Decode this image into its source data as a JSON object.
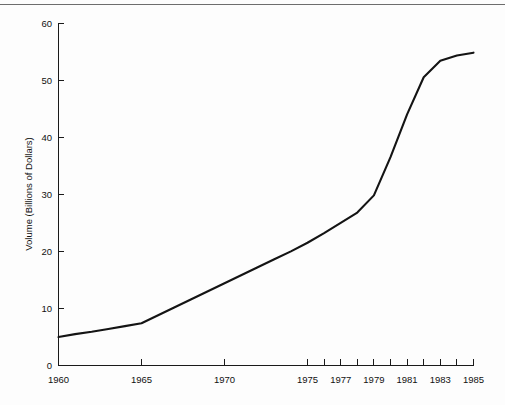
{
  "figure": {
    "name": "line-chart-figure",
    "background_color": "#fdfdfd",
    "line_color": "#141414",
    "axis_color": "#1a1a1a",
    "rule_top_color": "#6d6d6d",
    "rule_bottom_color": "#1a1a1a"
  },
  "chart_data": {
    "type": "line",
    "title": "",
    "subtitle": "",
    "xlabel": "",
    "ylabel": "Volume (Billions of Dollars)",
    "xlim": [
      1960,
      1985
    ],
    "ylim": [
      0,
      60
    ],
    "grid": false,
    "legend": null,
    "legend_position": "none",
    "ytick_labels": [
      "0",
      "10",
      "20",
      "30",
      "40",
      "50",
      "60"
    ],
    "ytick_values": [
      0,
      10,
      20,
      30,
      40,
      50,
      60
    ],
    "xtick_values": [
      1960,
      1965,
      1970,
      1975,
      1976,
      1977,
      1978,
      1979,
      1980,
      1981,
      1982,
      1983,
      1984,
      1985
    ],
    "xtick_labels": [
      "1960",
      "1965",
      "1970",
      "1975",
      "",
      "1977",
      "",
      "1979",
      "",
      "1981",
      "",
      "1983",
      "",
      "1985"
    ],
    "annotations": [],
    "series": [
      {
        "name": "Volume",
        "x": [
          1960,
          1961,
          1962,
          1963,
          1964,
          1965,
          1966,
          1967,
          1968,
          1969,
          1970,
          1971,
          1972,
          1973,
          1974,
          1975,
          1976,
          1977,
          1978,
          1979,
          1980,
          1981,
          1982,
          1983,
          1984,
          1985
        ],
        "values": [
          5.0,
          5.5,
          5.9,
          6.4,
          6.9,
          7.4,
          8.8,
          10.2,
          11.6,
          13.0,
          14.4,
          15.8,
          17.2,
          18.6,
          20.0,
          21.5,
          23.2,
          25.0,
          26.8,
          29.8,
          36.5,
          44.0,
          50.5,
          53.4,
          54.3,
          54.8
        ]
      }
    ]
  }
}
